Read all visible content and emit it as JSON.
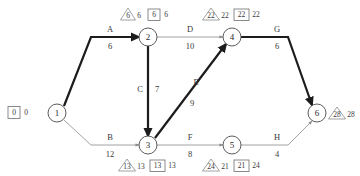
{
  "diagram": {
    "type": "activity-on-arrow-network",
    "title": "",
    "nodes": [
      {
        "id": "1",
        "label": "1",
        "x": 57,
        "y": 113
      },
      {
        "id": "2",
        "label": "2",
        "x": 148,
        "y": 37
      },
      {
        "id": "3",
        "label": "3",
        "x": 148,
        "y": 145
      },
      {
        "id": "4",
        "label": "4",
        "x": 232,
        "y": 37
      },
      {
        "id": "5",
        "label": "5",
        "x": 232,
        "y": 145
      },
      {
        "id": "6",
        "label": "6",
        "x": 317,
        "y": 113
      }
    ],
    "activities": [
      {
        "id": "A",
        "name": "A",
        "duration": "6",
        "from": "1",
        "to": "2",
        "critical": true,
        "name_x": 110,
        "name_y": 32,
        "dur_x": 110,
        "dur_y": 49
      },
      {
        "id": "B",
        "name": "B",
        "duration": "12",
        "from": "1",
        "to": "3",
        "critical": false,
        "name_x": 110,
        "name_y": 140,
        "dur_x": 110,
        "dur_y": 157
      },
      {
        "id": "C",
        "name": "C",
        "duration": "7",
        "from": "2",
        "to": "3",
        "critical": true,
        "name_x": 140,
        "name_y": 92,
        "dur_x": 156,
        "dur_y": 92
      },
      {
        "id": "D",
        "name": "D",
        "duration": "10",
        "from": "2",
        "to": "4",
        "critical": false,
        "name_x": 190,
        "name_y": 32,
        "dur_x": 190,
        "dur_y": 49
      },
      {
        "id": "E",
        "name": "E",
        "duration": "9",
        "from": "3",
        "to": "4",
        "critical": true,
        "name_x": 196,
        "name_y": 85,
        "dur_x": 192,
        "dur_y": 106
      },
      {
        "id": "F",
        "name": "F",
        "duration": "8",
        "from": "3",
        "to": "5",
        "critical": false,
        "name_x": 190,
        "name_y": 140,
        "dur_x": 190,
        "dur_y": 157
      },
      {
        "id": "G",
        "name": "G",
        "duration": "6",
        "from": "4",
        "to": "6",
        "critical": true,
        "name_x": 277,
        "name_y": 32,
        "dur_x": 277,
        "dur_y": 49
      },
      {
        "id": "H",
        "name": "H",
        "duration": "4",
        "from": "5",
        "to": "6",
        "critical": false,
        "name_x": 277,
        "name_y": 140,
        "dur_x": 277,
        "dur_y": 157
      }
    ],
    "node_tags": [
      {
        "node": "1",
        "kind": "box",
        "values": [
          "0",
          "0"
        ],
        "x": 18,
        "y": 113
      },
      {
        "node": "2",
        "kind": "triangle",
        "values": [
          "6",
          "6"
        ],
        "x": 129,
        "y": 14
      },
      {
        "node": "2",
        "kind": "box",
        "values": [
          "6",
          "6"
        ],
        "x": 168,
        "y": 14
      },
      {
        "node": "4",
        "kind": "triangle",
        "values": [
          "22",
          "22"
        ],
        "x": 213,
        "y": 14
      },
      {
        "node": "4",
        "kind": "box",
        "values": [
          "22",
          "22"
        ],
        "x": 253,
        "y": 14
      },
      {
        "node": "3",
        "kind": "triangle",
        "values": [
          "13",
          "13"
        ],
        "x": 129,
        "y": 166
      },
      {
        "node": "3",
        "kind": "box",
        "values": [
          "13",
          "13"
        ],
        "x": 169,
        "y": 166
      },
      {
        "node": "5",
        "kind": "triangle",
        "values": [
          "24",
          "21"
        ],
        "x": 213,
        "y": 166
      },
      {
        "node": "5",
        "kind": "box",
        "values": [
          "21",
          "24"
        ],
        "x": 253,
        "y": 166
      },
      {
        "node": "6",
        "kind": "triangle",
        "values": [
          "28",
          "28"
        ],
        "x": 339,
        "y": 113
      }
    ],
    "colors": {
      "critical_path": "#1c1c1c",
      "normal_edge": "#8c8c8c",
      "node_stroke": "#4a4a4a",
      "text": "#3a3a3a",
      "background": "#ffffff"
    },
    "critical_path_sequence": [
      "1",
      "2",
      "3",
      "4",
      "6"
    ]
  }
}
